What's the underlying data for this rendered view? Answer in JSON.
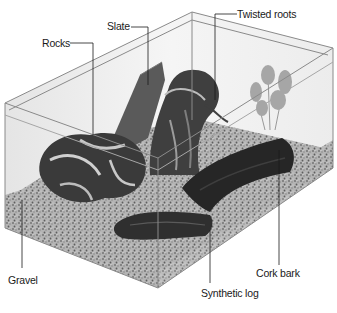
{
  "figure": {
    "labels": [
      {
        "id": "slate",
        "text": "Slate"
      },
      {
        "id": "rocks",
        "text": "Rocks"
      },
      {
        "id": "twisted_roots",
        "text": "Twisted roots"
      },
      {
        "id": "gravel",
        "text": "Gravel"
      },
      {
        "id": "cork_bark",
        "text": "Cork bark"
      },
      {
        "id": "synthetic_log",
        "text": "Synthetic log"
      }
    ]
  },
  "colors": {
    "background": "#ffffff",
    "glass_edge": "#8a8a8a",
    "gravel": "#a8a8a8",
    "dark_wood": "#2e2e2e",
    "slate": "#5a5a5a",
    "plant": "#9a9a9a",
    "label_text": "#1a1a1a"
  }
}
